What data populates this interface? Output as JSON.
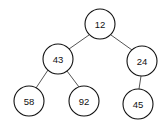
{
  "diagram": {
    "type": "binary-tree",
    "nodes": [
      {
        "id": "n12",
        "label": "12",
        "cx": 100,
        "cy": 24
      },
      {
        "id": "n43",
        "label": "43",
        "cx": 58,
        "cy": 59
      },
      {
        "id": "n24",
        "label": "24",
        "cx": 142,
        "cy": 61
      },
      {
        "id": "n58",
        "label": "58",
        "cx": 29,
        "cy": 101
      },
      {
        "id": "n92",
        "label": "92",
        "cx": 84,
        "cy": 101
      },
      {
        "id": "n45",
        "label": "45",
        "cx": 138,
        "cy": 104
      }
    ],
    "edges": [
      {
        "from": "12",
        "to": "43"
      },
      {
        "from": "12",
        "to": "24"
      },
      {
        "from": "43",
        "to": "58"
      },
      {
        "from": "43",
        "to": "92"
      },
      {
        "from": "24",
        "to": "45"
      }
    ],
    "node_radius": 15
  }
}
